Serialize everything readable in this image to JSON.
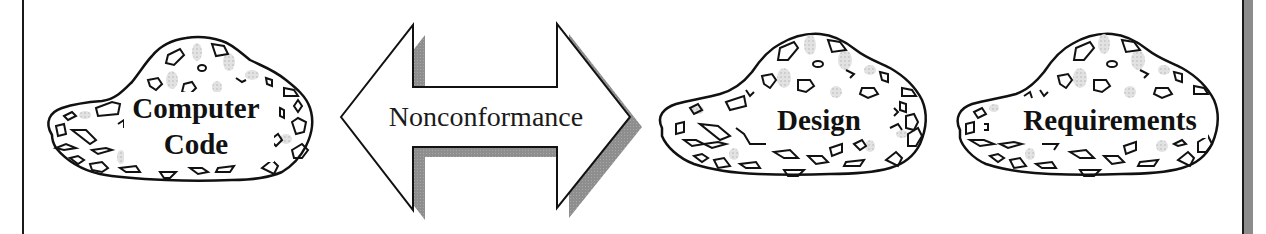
{
  "diagram": {
    "type": "concept-relationship",
    "colors": {
      "outline": "#111111",
      "shadow": "#8c8c8c",
      "speckle": "#d9d9d9",
      "background": "#ffffff"
    },
    "left_cloud": {
      "label_line1": "Computer",
      "label_line2": "Code"
    },
    "connector": {
      "shape": "double-headed-arrow",
      "label": "Nonconformance"
    },
    "right_clouds": [
      {
        "label": "Design"
      },
      {
        "label": "Requirements"
      }
    ]
  }
}
